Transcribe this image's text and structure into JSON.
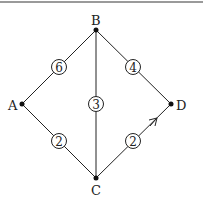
{
  "diagram": {
    "type": "weighted-graph",
    "nodes": [
      {
        "id": "A",
        "label": "A"
      },
      {
        "id": "B",
        "label": "B"
      },
      {
        "id": "C",
        "label": "C"
      },
      {
        "id": "D",
        "label": "D"
      }
    ],
    "edges": [
      {
        "from": "A",
        "to": "B",
        "weight": "6",
        "directed": false
      },
      {
        "from": "B",
        "to": "D",
        "weight": "4",
        "directed": false
      },
      {
        "from": "B",
        "to": "C",
        "weight": "3",
        "directed": false
      },
      {
        "from": "A",
        "to": "C",
        "weight": "2",
        "directed": false
      },
      {
        "from": "C",
        "to": "D",
        "weight": "2",
        "directed": true
      }
    ],
    "colors": {
      "line": "#222222",
      "node": "#111111",
      "rule": "#9a9a9a"
    }
  }
}
